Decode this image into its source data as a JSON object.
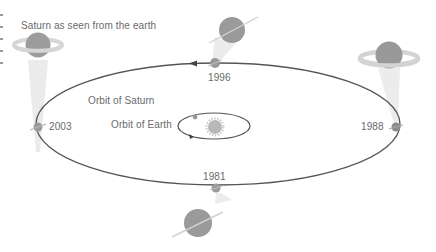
{
  "diagram": {
    "title": "Saturn as seen from the earth",
    "labels": {
      "orbit_saturn": "Orbit of Saturn",
      "orbit_earth": "Orbit of Earth"
    },
    "positions": [
      {
        "year": "1996",
        "location": "top",
        "ring_view": "edge-on"
      },
      {
        "year": "1988",
        "location": "right",
        "ring_view": "open"
      },
      {
        "year": "1981",
        "location": "bottom",
        "ring_view": "edge-on"
      },
      {
        "year": "2003",
        "location": "left",
        "ring_view": "open"
      }
    ],
    "colors": {
      "orbit_line": "#555555",
      "planet": "#9a9a9a",
      "ring": "#d2d2d2",
      "beam": "#ececec",
      "sun": "#b4b4b4",
      "text": "#6a6a6a"
    }
  }
}
